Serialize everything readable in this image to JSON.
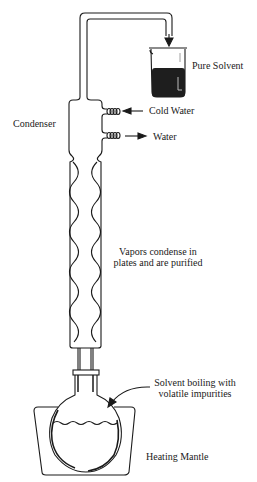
{
  "diagram": {
    "type": "fractional distillation apparatus",
    "labels": {
      "pure_solvent": "Pure Solvent",
      "condenser": "Condenser",
      "cold_water": "Cold Water",
      "water": "Water",
      "vapors_line1": "Vapors condense in",
      "vapors_line2": "plates and are purified",
      "boiling_line1": "Solvent boiling with",
      "boiling_line2": "volatile impurities",
      "heating_mantle": "Heating Mantle"
    },
    "components": [
      {
        "name": "delivery-tube",
        "icon": "bent-tube"
      },
      {
        "name": "receiving-beaker",
        "icon": "beaker",
        "contents": "Pure Solvent"
      },
      {
        "name": "condenser",
        "icon": "condenser-jacket"
      },
      {
        "name": "cold-water-inlet",
        "icon": "hose-barb",
        "flow": "in"
      },
      {
        "name": "water-outlet",
        "icon": "hose-barb",
        "flow": "out"
      },
      {
        "name": "fractionating-column",
        "icon": "vigreux-column"
      },
      {
        "name": "ground-glass-joint",
        "icon": "joint"
      },
      {
        "name": "round-bottom-flask",
        "icon": "flask"
      },
      {
        "name": "heating-mantle",
        "icon": "mantle"
      }
    ],
    "colors": {
      "line": "#1a1a1a",
      "liquid": "#1e1e1e",
      "background": "#ffffff"
    }
  }
}
